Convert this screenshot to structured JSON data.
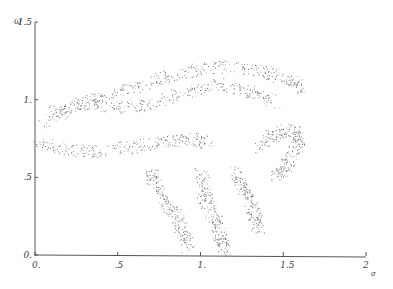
{
  "chart_data": {
    "type": "scatter",
    "title": "",
    "xlabel": "σ",
    "ylabel": "ω",
    "xlim": [
      0,
      2
    ],
    "ylim": [
      0,
      1.5
    ],
    "grid": false,
    "legend": null,
    "x_ticks": [
      {
        "value": 0,
        "label": "0."
      },
      {
        "value": 0.5,
        "label": ".5"
      },
      {
        "value": 1,
        "label": "1."
      },
      {
        "value": 1.5,
        "label": "1.5"
      },
      {
        "value": 2,
        "label": "2"
      }
    ],
    "y_ticks": [
      {
        "value": 0,
        "label": "0."
      },
      {
        "value": 0.5,
        "label": ".5"
      },
      {
        "value": 1,
        "label": "1."
      },
      {
        "value": 1.5,
        "label": "1.5"
      }
    ],
    "regions": [
      {
        "name": "upper-band",
        "points": [
          [
            0.05,
            0.85
          ],
          [
            0.2,
            0.95
          ],
          [
            0.4,
            1.02
          ],
          [
            0.6,
            1.08
          ],
          [
            0.8,
            1.15
          ],
          [
            1.0,
            1.2
          ],
          [
            1.2,
            1.22
          ],
          [
            1.4,
            1.18
          ],
          [
            1.55,
            1.12
          ],
          [
            1.6,
            1.08
          ]
        ]
      },
      {
        "name": "inner-upper-band",
        "points": [
          [
            0.1,
            0.92
          ],
          [
            0.3,
            0.98
          ],
          [
            0.5,
            0.95
          ],
          [
            0.7,
            0.97
          ],
          [
            0.9,
            1.05
          ],
          [
            1.1,
            1.1
          ],
          [
            1.3,
            1.05
          ],
          [
            1.45,
            0.98
          ]
        ]
      },
      {
        "name": "lower-band",
        "points": [
          [
            0.02,
            0.72
          ],
          [
            0.2,
            0.68
          ],
          [
            0.4,
            0.67
          ],
          [
            0.6,
            0.7
          ],
          [
            0.8,
            0.73
          ],
          [
            0.95,
            0.75
          ],
          [
            1.05,
            0.72
          ]
        ]
      },
      {
        "name": "left-lobe",
        "points": [
          [
            0.7,
            0.55
          ],
          [
            0.72,
            0.45
          ],
          [
            0.78,
            0.35
          ],
          [
            0.85,
            0.25
          ],
          [
            0.9,
            0.15
          ],
          [
            0.92,
            0.05
          ]
        ]
      },
      {
        "name": "middle-lobe",
        "points": [
          [
            1.0,
            0.55
          ],
          [
            1.02,
            0.4
          ],
          [
            1.05,
            0.3
          ],
          [
            1.1,
            0.2
          ],
          [
            1.12,
            0.1
          ],
          [
            1.15,
            0.02
          ]
        ]
      },
      {
        "name": "right-lobe",
        "points": [
          [
            1.2,
            0.55
          ],
          [
            1.25,
            0.45
          ],
          [
            1.3,
            0.35
          ],
          [
            1.33,
            0.25
          ],
          [
            1.35,
            0.15
          ]
        ]
      },
      {
        "name": "hook",
        "points": [
          [
            1.35,
            0.7
          ],
          [
            1.45,
            0.78
          ],
          [
            1.55,
            0.82
          ],
          [
            1.6,
            0.75
          ],
          [
            1.55,
            0.65
          ],
          [
            1.5,
            0.55
          ],
          [
            1.45,
            0.5
          ]
        ]
      }
    ]
  }
}
